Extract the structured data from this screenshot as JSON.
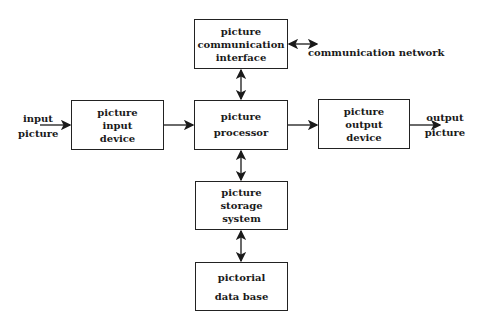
{
  "diagram": {
    "nodes": {
      "comm_interface": [
        "picture",
        "communication",
        "interface"
      ],
      "input_device": [
        "picture",
        "input",
        "device"
      ],
      "processor": [
        "picture",
        "processor"
      ],
      "output_device": [
        "picture",
        "output",
        "device"
      ],
      "storage": [
        "picture",
        "storage",
        "system"
      ],
      "database": [
        "pictorial",
        "data base"
      ]
    },
    "external_labels": {
      "input": [
        "input",
        "picture"
      ],
      "output": [
        "output",
        "picture"
      ],
      "network": "communication network"
    },
    "edges": [
      {
        "from": "input picture",
        "to": "picture input device",
        "type": "arrow"
      },
      {
        "from": "picture input device",
        "to": "picture processor",
        "type": "arrow"
      },
      {
        "from": "picture processor",
        "to": "picture output device",
        "type": "arrow"
      },
      {
        "from": "picture output device",
        "to": "output picture",
        "type": "arrow"
      },
      {
        "from": "picture processor",
        "to": "picture communication interface",
        "type": "bidirectional"
      },
      {
        "from": "picture communication interface",
        "to": "communication network",
        "type": "bidirectional"
      },
      {
        "from": "picture processor",
        "to": "picture storage system",
        "type": "bidirectional"
      },
      {
        "from": "picture storage system",
        "to": "pictorial data base",
        "type": "bidirectional"
      }
    ]
  }
}
